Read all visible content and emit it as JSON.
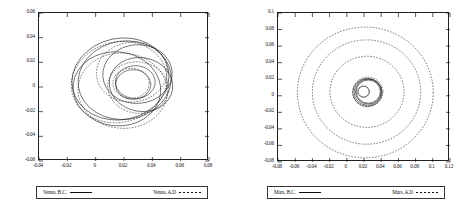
{
  "figure": {
    "background": "#ffffff",
    "line_color": "#111111",
    "panel_count": 2
  },
  "chart_data": [
    {
      "type": "line",
      "title": "",
      "panel": "left",
      "xlabel": "",
      "ylabel": "",
      "xlim": [
        -0.04,
        0.08
      ],
      "ylim": [
        -0.06,
        0.06
      ],
      "grid": false,
      "legend_position": "below",
      "xticks": [
        "-0.04",
        "-0.02",
        "0",
        "0.02",
        "0.04",
        "0.06",
        "0.08"
      ],
      "xtick_values": [
        -0.04,
        -0.02,
        0,
        0.02,
        0.04,
        0.06,
        0.08
      ],
      "yticks": [
        "0.06",
        "0.04",
        "0.02",
        "0",
        "-0.02",
        "-0.04",
        "-0.06"
      ],
      "ytick_values": [
        0.06,
        0.04,
        0.02,
        0,
        -0.02,
        -0.04,
        -0.06
      ],
      "series": [
        {
          "name": "Venus, B.C.",
          "style": "solid",
          "loops": [
            {
              "cx": 0.0175,
              "cy": 0.0065,
              "rx": 0.0345,
              "ry": 0.033,
              "rot": -12
            },
            {
              "cx": 0.0205,
              "cy": 0.0055,
              "rx": 0.033,
              "ry": 0.0318,
              "rot": -8
            },
            {
              "cx": 0.015,
              "cy": -0.0015,
              "rx": 0.031,
              "ry": 0.03,
              "rot": 6
            },
            {
              "cx": 0.0295,
              "cy": 0.0105,
              "rx": 0.0245,
              "ry": 0.0238,
              "rot": -4
            },
            {
              "cx": 0.032,
              "cy": 0.002,
              "rx": 0.0225,
              "ry": 0.0218,
              "rot": 10
            },
            {
              "cx": 0.028,
              "cy": 0.004,
              "rx": 0.014,
              "ry": 0.0133,
              "rot": 0
            },
            {
              "cx": 0.0265,
              "cy": 0.002,
              "rx": 0.0125,
              "ry": 0.012,
              "rot": 0
            }
          ]
        },
        {
          "name": "Venus, A.D",
          "style": "dashed",
          "loops": [
            {
              "cx": 0.0165,
              "cy": 0.004,
              "rx": 0.034,
              "ry": 0.0326,
              "rot": -14
            },
            {
              "cx": 0.019,
              "cy": -0.003,
              "rx": 0.0315,
              "ry": 0.0305,
              "rot": 4
            },
            {
              "cx": 0.0255,
              "cy": 0.012,
              "rx": 0.025,
              "ry": 0.0242,
              "rot": -6
            },
            {
              "cx": 0.03,
              "cy": -0.0005,
              "rx": 0.0215,
              "ry": 0.0208,
              "rot": 8
            },
            {
              "cx": 0.025,
              "cy": 0.003,
              "rx": 0.0128,
              "ry": 0.0122,
              "rot": 0
            }
          ]
        }
      ],
      "legend": [
        {
          "label": "Venus, B.C.",
          "style": "solid"
        },
        {
          "label": "Venus, A.D",
          "style": "dashed"
        }
      ]
    },
    {
      "type": "line",
      "title": "",
      "panel": "right",
      "xlabel": "",
      "ylabel": "",
      "xlim": [
        -0.08,
        0.12
      ],
      "ylim": [
        -0.08,
        0.1
      ],
      "grid": false,
      "legend_position": "below",
      "xticks": [
        "-0.08",
        "-0.06",
        "-0.04",
        "-0.02",
        "0",
        "0.02",
        "0.04",
        "0.06",
        "0.08",
        "0.1",
        "0.12"
      ],
      "xtick_values": [
        -0.08,
        -0.06,
        -0.04,
        -0.02,
        0,
        0.02,
        0.04,
        0.06,
        0.08,
        0.1,
        0.12
      ],
      "yticks": [
        "0.1",
        "0.08",
        "0.06",
        "0.04",
        "0.02",
        "0",
        "-0.02",
        "-0.04",
        "-0.06",
        "-0.08"
      ],
      "ytick_values": [
        0.1,
        0.08,
        0.06,
        0.04,
        0.02,
        0,
        -0.02,
        -0.04,
        -0.06,
        -0.08
      ],
      "series": [
        {
          "name": "Mars, B.C.",
          "style": "solid",
          "loops": [
            {
              "cx": 0.025,
              "cy": 0.005,
              "rx": 0.014,
              "ry": 0.014,
              "rot": 0
            },
            {
              "cx": 0.025,
              "cy": 0.005,
              "rx": 0.015,
              "ry": 0.015,
              "rot": 0
            },
            {
              "cx": 0.0245,
              "cy": 0.0045,
              "rx": 0.016,
              "ry": 0.016,
              "rot": 0
            },
            {
              "cx": 0.024,
              "cy": 0.004,
              "rx": 0.0172,
              "ry": 0.0172,
              "rot": 0
            },
            {
              "cx": 0.0195,
              "cy": 0.005,
              "rx": 0.0065,
              "ry": 0.0065,
              "rot": 0
            }
          ]
        },
        {
          "name": "Mars, A.D",
          "style": "dashed",
          "loops": [
            {
              "cx": 0.0215,
              "cy": 0.004,
              "rx": 0.079,
              "ry": 0.079,
              "rot": 0
            },
            {
              "cx": 0.023,
              "cy": 0.0045,
              "rx": 0.063,
              "ry": 0.063,
              "rot": 0
            },
            {
              "cx": 0.0235,
              "cy": 0.0048,
              "rx": 0.043,
              "ry": 0.043,
              "rot": 0
            },
            {
              "cx": 0.0245,
              "cy": 0.005,
              "rx": 0.0175,
              "ry": 0.0175,
              "rot": 0
            },
            {
              "cx": 0.0195,
              "cy": 0.005,
              "rx": 0.0068,
              "ry": 0.0068,
              "rot": 0
            }
          ]
        }
      ],
      "legend": [
        {
          "label": "Mars, B.C.",
          "style": "solid"
        },
        {
          "label": "Mars, A.D",
          "style": "dashed"
        }
      ]
    }
  ]
}
